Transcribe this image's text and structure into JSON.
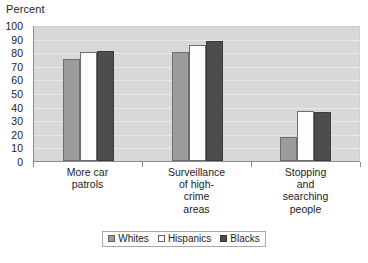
{
  "chart_data": {
    "type": "bar",
    "title": "",
    "xlabel": "",
    "ylabel": "Percent",
    "ylim": [
      0,
      100
    ],
    "ytick_step": 10,
    "yticks": [
      100,
      90,
      80,
      70,
      60,
      50,
      40,
      30,
      20,
      10,
      0
    ],
    "grid": true,
    "legend_position": "bottom",
    "categories": [
      "More car patrols",
      "Surveillance of high-crime areas",
      "Stopping and searching people"
    ],
    "category_label_lines": [
      [
        "More car",
        "patrols"
      ],
      [
        "Surveillance",
        "of high-",
        "crime",
        "areas"
      ],
      [
        "Stopping",
        "and",
        "searching",
        "people"
      ]
    ],
    "series": [
      {
        "name": "Whites",
        "color": "#9c9c9c",
        "values": [
          75,
          80,
          18
        ]
      },
      {
        "name": "Hispanics",
        "color": "#ffffff",
        "values": [
          80,
          85,
          37
        ]
      },
      {
        "name": "Blacks",
        "color": "#4d4d4d",
        "values": [
          81,
          88,
          36
        ]
      }
    ],
    "plot_background": "#d8d8d8",
    "gridline_color": "#e8e8e8",
    "axis_color": "#8c8c8c"
  },
  "legend": {
    "items": [
      {
        "label": "Whites"
      },
      {
        "label": "Hispanics"
      },
      {
        "label": "Blacks"
      }
    ]
  }
}
